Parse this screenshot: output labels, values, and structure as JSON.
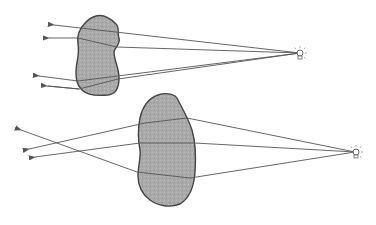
{
  "diagram": {
    "type": "ray-optics",
    "background": "#ffffff",
    "colors": {
      "ray": "#555555",
      "object_fill": "#a9a9a9",
      "object_stroke": "#444444",
      "source": "#666666"
    },
    "panels": [
      {
        "name": "top",
        "source": {
          "x": 300,
          "y": 53
        },
        "object": "irregular-body-top",
        "rays": [
          {
            "from": [
              300,
              53
            ],
            "to": [
              52,
              25
            ]
          },
          {
            "from": [
              300,
              53
            ],
            "to": [
              46,
              38
            ]
          },
          {
            "from": [
              300,
              53
            ],
            "to": [
              36,
              76
            ]
          },
          {
            "from": [
              300,
              53
            ],
            "to": [
              45,
              86
            ]
          }
        ]
      },
      {
        "name": "bottom",
        "source": {
          "x": 355,
          "y": 152
        },
        "object": "irregular-body-bottom",
        "rays": [
          {
            "from": [
              355,
              152
            ],
            "to": [
              18,
              129
            ]
          },
          {
            "from": [
              355,
              152
            ],
            "to": [
              26,
              149
            ]
          },
          {
            "from": [
              355,
              152
            ],
            "to": [
              33,
              157
            ]
          }
        ]
      }
    ]
  }
}
